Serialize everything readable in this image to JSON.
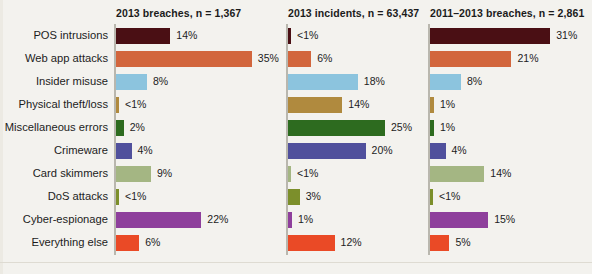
{
  "chart_data": {
    "type": "bar",
    "title": "",
    "subtitle": "",
    "xlabel": "",
    "ylabel": "",
    "orientation": "horizontal",
    "grid": false,
    "legend": "none",
    "xlim": [
      0,
      35
    ],
    "categories": [
      "POS intrusions",
      "Web app attacks",
      "Insider misuse",
      "Physical theft/loss",
      "Miscellaneous errors",
      "Crimeware",
      "Card skimmers",
      "DoS attacks",
      "Cyber-espionage",
      "Everything else"
    ],
    "category_colors": [
      "#4a0f14",
      "#d2663d",
      "#8cc4de",
      "#b08a3e",
      "#2d6b1f",
      "#50509c",
      "#a4b683",
      "#7c8f2b",
      "#8e3f9c",
      "#ea4a26"
    ],
    "panels": [
      {
        "title": "2013 breaches, n = 1,367",
        "values": [
          14,
          35,
          8,
          0.5,
          2,
          4,
          9,
          0.5,
          22,
          6
        ],
        "value_labels": [
          "14%",
          "35%",
          "8%",
          "<1%",
          "2%",
          "4%",
          "9%",
          "<1%",
          "22%",
          "6%"
        ]
      },
      {
        "title": "2013 incidents, n = 63,437",
        "values": [
          0.5,
          6,
          18,
          14,
          25,
          20,
          0.5,
          3,
          1,
          12
        ],
        "value_labels": [
          "<1%",
          "6%",
          "18%",
          "14%",
          "25%",
          "20%",
          "<1%",
          "3%",
          "1%",
          "12%"
        ]
      },
      {
        "title": "2011–2013 breaches, n = 2,861",
        "values": [
          31,
          21,
          8,
          1,
          1,
          4,
          14,
          0.5,
          15,
          5
        ],
        "value_labels": [
          "31%",
          "21%",
          "8%",
          "1%",
          "1%",
          "4%",
          "14%",
          "<1%",
          "15%",
          "5%"
        ]
      }
    ]
  },
  "style": {
    "background": "#f3f2ee",
    "text_color": "#1c1c1c",
    "axis_color": "#b9b7ae"
  }
}
